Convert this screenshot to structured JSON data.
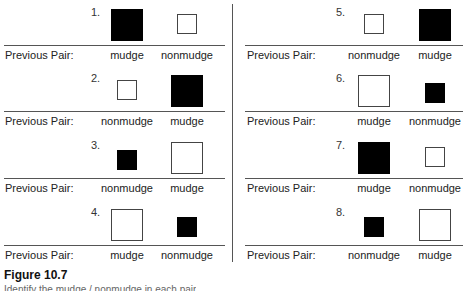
{
  "figure": {
    "title": "Figure 10.7",
    "caption": "Identify the mudge / nonmudge in each pair"
  },
  "label_prefix": "Previous Pair:",
  "trials": [
    {
      "num": "1.",
      "left": {
        "color": "black",
        "size": "large"
      },
      "right": {
        "color": "white",
        "size": "small"
      },
      "left_label": "mudge",
      "right_label": "nonmudge"
    },
    {
      "num": "2.",
      "left": {
        "color": "white",
        "size": "small"
      },
      "right": {
        "color": "black",
        "size": "large"
      },
      "left_label": "nonmudge",
      "right_label": "mudge"
    },
    {
      "num": "3.",
      "left": {
        "color": "black",
        "size": "small"
      },
      "right": {
        "color": "white",
        "size": "large"
      },
      "left_label": "nonmudge",
      "right_label": "mudge"
    },
    {
      "num": "4.",
      "left": {
        "color": "white",
        "size": "large"
      },
      "right": {
        "color": "black",
        "size": "small"
      },
      "left_label": "mudge",
      "right_label": "nonmudge"
    },
    {
      "num": "5.",
      "left": {
        "color": "white",
        "size": "small"
      },
      "right": {
        "color": "black",
        "size": "large"
      },
      "left_label": "nonmudge",
      "right_label": "mudge"
    },
    {
      "num": "6.",
      "left": {
        "color": "white",
        "size": "large"
      },
      "right": {
        "color": "black",
        "size": "small"
      },
      "left_label": "mudge",
      "right_label": "nonmudge"
    },
    {
      "num": "7.",
      "left": {
        "color": "black",
        "size": "large"
      },
      "right": {
        "color": "white",
        "size": "small"
      },
      "left_label": "mudge",
      "right_label": "nonmudge"
    },
    {
      "num": "8.",
      "left": {
        "color": "black",
        "size": "small"
      },
      "right": {
        "color": "white",
        "size": "large"
      },
      "left_label": "nonmudge",
      "right_label": "mudge"
    }
  ]
}
